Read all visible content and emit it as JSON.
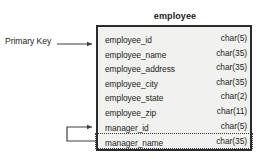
{
  "diagram": {
    "type": "entity-relationship-table",
    "table": {
      "title": "employee",
      "columns": {
        "name_header": "field",
        "type_header": "datatype"
      },
      "fields": [
        {
          "name": "employee_id",
          "type": "char(5)",
          "highlighted": false
        },
        {
          "name": "employee_name",
          "type": "char(35)",
          "highlighted": false
        },
        {
          "name": "employee_address",
          "type": "char(35)",
          "highlighted": false
        },
        {
          "name": "employee_city",
          "type": "char(35)",
          "highlighted": false
        },
        {
          "name": "employee_state",
          "type": "char(2)",
          "highlighted": false
        },
        {
          "name": "employee_zip",
          "type": "char(11)",
          "highlighted": false
        },
        {
          "name": "manager_id",
          "type": "char(5)",
          "highlighted": false
        },
        {
          "name": "manager_name",
          "type": "char(35)",
          "highlighted": true
        }
      ]
    },
    "annotations": [
      {
        "label": "Primary Key",
        "target_field": "employee_id"
      }
    ],
    "relationships": [
      {
        "from_field": "manager_name",
        "to_field": "manager_id",
        "style": "self-referencing-arrow"
      }
    ],
    "colors": {
      "background": "#ffffff",
      "box_fill": "#f1f1ef",
      "box_border": "#2b2b2b",
      "text": "#231f20",
      "connector": "#3f3f3f",
      "dotted_border": "#3a3a3a"
    }
  }
}
